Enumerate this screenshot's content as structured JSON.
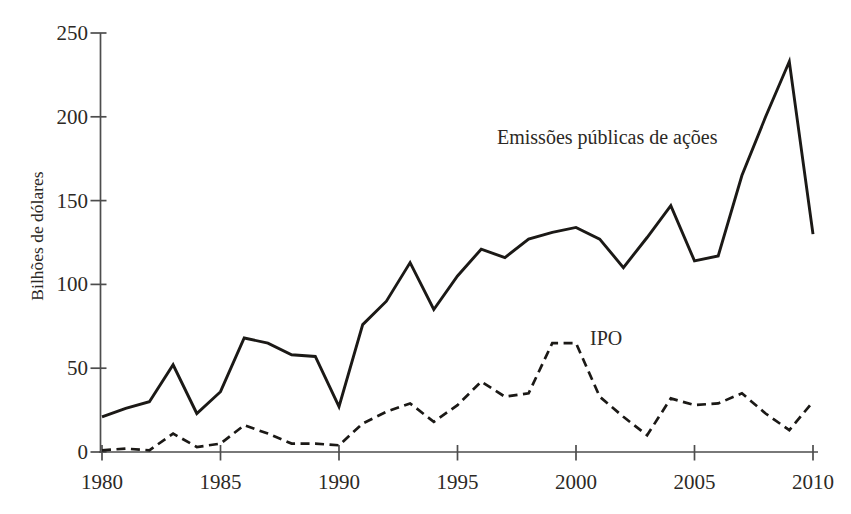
{
  "figure": {
    "background": "#ffffff",
    "line_color": "#1b1916",
    "axis_color": "#4d4d4d",
    "text_color": "#2c2925"
  },
  "chart_data": {
    "type": "line",
    "title": "",
    "xlabel": "",
    "ylabel": "Bilhões de dólares",
    "xlim": [
      1980,
      2010
    ],
    "ylim": [
      0,
      250
    ],
    "x_ticks": [
      1980,
      1985,
      1990,
      1995,
      2000,
      2005,
      2010
    ],
    "y_ticks": [
      0,
      50,
      100,
      150,
      200,
      250
    ],
    "grid": false,
    "legend_position": "inline-annotations",
    "x": [
      1980,
      1981,
      1982,
      1983,
      1984,
      1985,
      1986,
      1987,
      1988,
      1989,
      1990,
      1991,
      1992,
      1993,
      1994,
      1995,
      1996,
      1997,
      1998,
      1999,
      2000,
      2001,
      2002,
      2003,
      2004,
      2005,
      2006,
      2007,
      2008,
      2009,
      2010
    ],
    "series": [
      {
        "name": "Emissões públicas de ações",
        "style": "solid",
        "values": [
          21,
          26,
          30,
          52,
          23,
          36,
          68,
          65,
          58,
          57,
          27,
          76,
          90,
          113,
          85,
          105,
          121,
          116,
          127,
          131,
          134,
          127,
          110,
          128,
          147,
          114,
          117,
          165,
          200,
          233,
          130
        ]
      },
      {
        "name": "IPO",
        "style": "dashed",
        "values": [
          1,
          2,
          1,
          11,
          3,
          5,
          16,
          11,
          5,
          5,
          4,
          17,
          24,
          29,
          18,
          28,
          42,
          33,
          35,
          65,
          65,
          33,
          21,
          10,
          32,
          28,
          29,
          35,
          23,
          13,
          30
        ]
      }
    ],
    "annotations": [
      {
        "text": "Emissões públicas de ações",
        "attached_series": "Emissões públicas de ações"
      },
      {
        "text": "IPO",
        "attached_series": "IPO"
      }
    ]
  }
}
